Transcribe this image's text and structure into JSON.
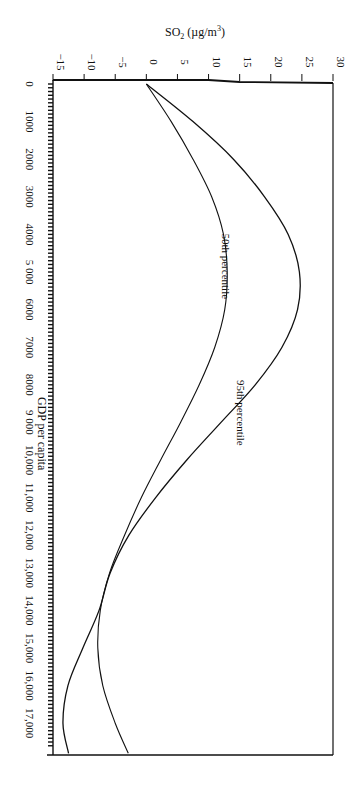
{
  "chart_data": {
    "type": "line",
    "orientation": "rotated-90-clockwise",
    "title": "",
    "xlabel": "GDP per capita",
    "ylabel": "SO₂ (µg/m³)",
    "ylabel_main": "SO",
    "ylabel_sub": "2",
    "ylabel_rest": " (µg/m",
    "ylabel_sup": "3",
    "ylabel_close": ")",
    "xlim": [
      0,
      17800
    ],
    "ylim": [
      -15,
      30
    ],
    "grid": false,
    "legend": "inline labels",
    "x_ticks": [
      {
        "value": 0,
        "label": "0"
      },
      {
        "value": 1000,
        "label": "1000"
      },
      {
        "value": 2000,
        "label": "2000"
      },
      {
        "value": 3000,
        "label": "3000"
      },
      {
        "value": 4000,
        "label": "4000"
      },
      {
        "value": 5000,
        "label": "5 000"
      },
      {
        "value": 6000,
        "label": "6000"
      },
      {
        "value": 7000,
        "label": "7000"
      },
      {
        "value": 8000,
        "label": "8000"
      },
      {
        "value": 9000,
        "label": "9 000"
      },
      {
        "value": 10000,
        "label": "10,000"
      },
      {
        "value": 11000,
        "label": "11,000"
      },
      {
        "value": 12000,
        "label": "12,000"
      },
      {
        "value": 13000,
        "label": "13,000"
      },
      {
        "value": 14000,
        "label": "14,000"
      },
      {
        "value": 15000,
        "label": "15,000"
      },
      {
        "value": 16000,
        "label": "16,000"
      },
      {
        "value": 17000,
        "label": "17,000"
      }
    ],
    "y_ticks": [
      {
        "value": -15,
        "label": "−15"
      },
      {
        "value": -10,
        "label": "−10"
      },
      {
        "value": -5,
        "label": "−5"
      },
      {
        "value": 0,
        "label": "0"
      },
      {
        "value": 5,
        "label": "5"
      },
      {
        "value": 10,
        "label": "10"
      },
      {
        "value": 15,
        "label": "15"
      },
      {
        "value": 20,
        "label": "20"
      },
      {
        "value": 25,
        "label": "25"
      },
      {
        "value": 30,
        "label": "30"
      }
    ],
    "x": [
      0,
      1000,
      2000,
      3000,
      4000,
      5000,
      6000,
      7000,
      8000,
      9000,
      10000,
      11000,
      12000,
      13000,
      14000,
      15000,
      16000,
      17000,
      17800
    ],
    "series": [
      {
        "name": "95th percentile",
        "label": "95th percentile",
        "values": [
          0,
          7.5,
          14,
          19,
          22.8,
          24.6,
          24.3,
          21.8,
          17.5,
          12,
          6.5,
          1.5,
          -2.8,
          -5.8,
          -7.6,
          -10.2,
          -12.6,
          -13.4,
          -12.5
        ]
      },
      {
        "name": "50th percentile",
        "label": "50th percentile",
        "values": [
          0,
          4,
          7.5,
          10.5,
          12.4,
          13,
          12.6,
          11,
          8.5,
          5.5,
          2.3,
          -0.8,
          -3.5,
          -5.9,
          -7.4,
          -7.8,
          -7,
          -5,
          -2.9
        ]
      }
    ],
    "annotations": [
      {
        "text": "50th percentile",
        "x": 6500,
        "y": 11.5
      },
      {
        "text": "95th percentile",
        "x": 10400,
        "y": 14
      }
    ]
  }
}
